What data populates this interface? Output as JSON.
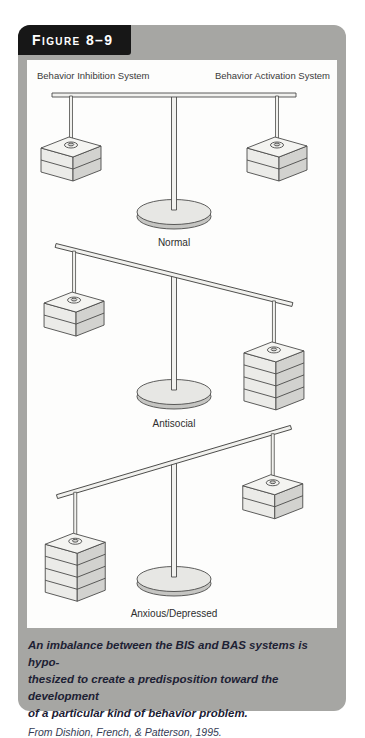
{
  "figure": {
    "label": "Figure 8–9"
  },
  "panel": {
    "left_header": "Behavior Inhibition System",
    "right_header": "Behavior Activation System"
  },
  "scales": [
    {
      "label": "Normal",
      "tilt_deg": 0,
      "left_weight_layers": 2,
      "right_weight_layers": 2
    },
    {
      "label": "Antisocial",
      "tilt_deg": 14,
      "left_weight_layers": 2,
      "right_weight_layers": 4
    },
    {
      "label": "Anxious/Depressed",
      "tilt_deg": -16.5,
      "left_weight_layers": 4,
      "right_weight_layers": 2
    }
  ],
  "caption": {
    "lines": [
      "An imbalance between the BIS and BAS systems is hypo-",
      "thesized to create a predisposition toward the development",
      "of a particular kind of behavior problem."
    ],
    "attribution": "From Dishion, French, & Patterson, 1995."
  },
  "colors": {
    "frame_gray": "#a6a6a3",
    "figure_label_bg": "#171717",
    "figure_label_text": "#ffffff",
    "panel_bg": "#fdfdfc",
    "outline": "#4b4b49",
    "box_top": "#f4f4f1",
    "box_front": "#ebebe8",
    "box_side": "#d2d2cf",
    "beam_fill": "#f1f1ee",
    "base_top": "#e7e7e4",
    "base_rim": "#c5c5c2",
    "caption_text": "#1d2134"
  }
}
